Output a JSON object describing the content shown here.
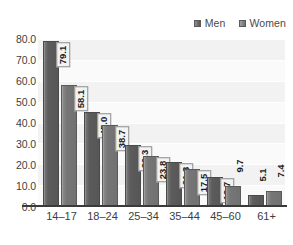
{
  "chart_data": {
    "type": "bar",
    "title": "",
    "subtitle": "",
    "xlabel": "",
    "ylabel": "",
    "categories": [
      "14–17",
      "18–24",
      "25–34",
      "35–44",
      "45–60",
      "61+"
    ],
    "series": [
      {
        "name": "Men",
        "color": "#5c5c5c",
        "values": [
          79.1,
          45.0,
          29.3,
          21.3,
          13.7,
          5.1
        ],
        "value_labels": [
          "79.1",
          "45.0",
          "29.3",
          "21.3",
          "13.7",
          "5.1"
        ]
      },
      {
        "name": "Women",
        "color": "#767676",
        "values": [
          58.1,
          38.7,
          23.8,
          17.5,
          9.7,
          7.4
        ],
        "value_labels": [
          "58.1",
          "38.7",
          "23.8",
          "17.5",
          "9.7",
          "7.4"
        ]
      }
    ],
    "ylim": [
      0.0,
      80.0
    ],
    "ytick_step": 10.0,
    "ytick_labels": [
      "80.0",
      "70.0",
      "60.0",
      "50.0",
      "40.0",
      "30.0",
      "20.0",
      "10.0",
      "0.0"
    ],
    "ytick_values": [
      80.0,
      70.0,
      60.0,
      50.0,
      40.0,
      30.0,
      20.0,
      10.0,
      0.0
    ],
    "grid": true,
    "grid_axis": "y",
    "legend": true,
    "legend_position": "top-right",
    "value_labels_shown": true,
    "value_label_rotation": -90,
    "plot_background": "#fafafa",
    "axis_line_color": "#3a3a3a"
  },
  "legend": {
    "entries": [
      {
        "label": "Men",
        "swatch_icon": "square-swatch-icon"
      },
      {
        "label": "Women",
        "swatch_icon": "square-swatch-icon"
      }
    ]
  },
  "axes": {
    "y": {
      "ticks": [
        "80.0",
        "70.0",
        "60.0",
        "50.0",
        "40.0",
        "30.0",
        "20.0",
        "10.0",
        "0.0"
      ]
    },
    "x": {
      "ticks": [
        "14–17",
        "18–24",
        "25–34",
        "35–44",
        "45–60",
        "61+"
      ]
    }
  }
}
